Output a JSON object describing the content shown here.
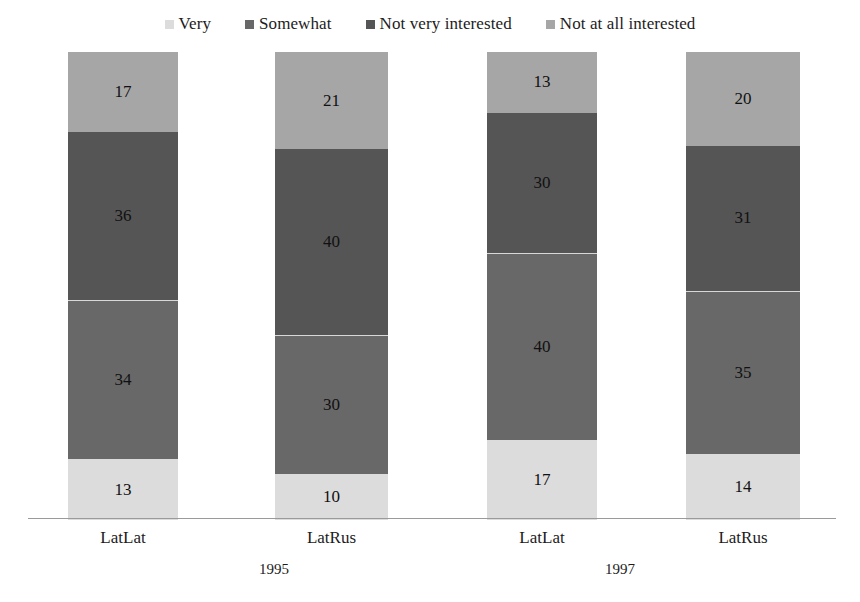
{
  "chart_data": {
    "type": "bar",
    "subtype": "stacked-vertical-100percent",
    "title": "",
    "subtitle": "",
    "xlabel": "",
    "ylabel": "",
    "ylim": [
      0,
      100
    ],
    "grid": false,
    "legend_position": "top-center",
    "categories": [
      "LatLat",
      "LatRus",
      "LatLat",
      "LatRus"
    ],
    "groups": [
      {
        "label": "1995",
        "category_indices": [
          0,
          1
        ]
      },
      {
        "label": "1997",
        "category_indices": [
          2,
          3
        ]
      }
    ],
    "series": [
      {
        "name": "Very",
        "color": "#dcdcdc",
        "values": [
          13,
          10,
          17,
          14
        ]
      },
      {
        "name": "Somewhat",
        "color": "#686868",
        "values": [
          34,
          30,
          40,
          35
        ]
      },
      {
        "name": "Not very interested",
        "color": "#555555",
        "values": [
          36,
          40,
          30,
          31
        ]
      },
      {
        "name": "Not at all interested",
        "color": "#a6a6a6",
        "values": [
          17,
          21,
          13,
          20
        ]
      }
    ],
    "bar_totals": [
      100,
      100,
      100,
      100
    ],
    "annotations": []
  },
  "legend": {
    "items": [
      {
        "label": "Very",
        "color": "#dcdcdc"
      },
      {
        "label": "Somewhat",
        "color": "#686868"
      },
      {
        "label": "Not very interested",
        "color": "#555555"
      },
      {
        "label": "Not at all interested",
        "color": "#a6a6a6"
      }
    ]
  },
  "bars": [
    {
      "category": "LatLat",
      "group": "1995",
      "segments": [
        {
          "series": "Very",
          "value": 13,
          "label": "13",
          "color": "#dcdcdc"
        },
        {
          "series": "Somewhat",
          "value": 34,
          "label": "34",
          "color": "#686868"
        },
        {
          "series": "Not very interested",
          "value": 36,
          "label": "36",
          "color": "#555555"
        },
        {
          "series": "Not at all interested",
          "value": 17,
          "label": "17",
          "color": "#a6a6a6"
        }
      ]
    },
    {
      "category": "LatRus",
      "group": "1995",
      "segments": [
        {
          "series": "Very",
          "value": 10,
          "label": "10",
          "color": "#dcdcdc"
        },
        {
          "series": "Somewhat",
          "value": 30,
          "label": "30",
          "color": "#686868"
        },
        {
          "series": "Not very interested",
          "value": 40,
          "label": "40",
          "color": "#555555"
        },
        {
          "series": "Not at all interested",
          "value": 21,
          "label": "21",
          "color": "#a6a6a6"
        }
      ]
    },
    {
      "category": "LatLat",
      "group": "1997",
      "segments": [
        {
          "series": "Very",
          "value": 17,
          "label": "17",
          "color": "#dcdcdc"
        },
        {
          "series": "Somewhat",
          "value": 40,
          "label": "40",
          "color": "#686868"
        },
        {
          "series": "Not very interested",
          "value": 30,
          "label": "30",
          "color": "#555555"
        },
        {
          "series": "Not at all interested",
          "value": 13,
          "label": "13",
          "color": "#a6a6a6"
        }
      ]
    },
    {
      "category": "LatRus",
      "group": "1997",
      "segments": [
        {
          "series": "Very",
          "value": 14,
          "label": "14",
          "color": "#dcdcdc"
        },
        {
          "series": "Somewhat",
          "value": 35,
          "label": "35",
          "color": "#686868"
        },
        {
          "series": "Not very interested",
          "value": 31,
          "label": "31",
          "color": "#555555"
        },
        {
          "series": "Not at all interested",
          "value": 20,
          "label": "20",
          "color": "#a6a6a6"
        }
      ]
    }
  ],
  "axis": {
    "baseline_color": "#9a9a9a"
  },
  "layout": {
    "bar_geometry": [
      {
        "left": 68,
        "width": 110
      },
      {
        "left": 275,
        "width": 113
      },
      {
        "left": 487,
        "width": 110
      },
      {
        "left": 686,
        "width": 114
      }
    ],
    "group_label_centers": [
      274,
      620
    ]
  }
}
